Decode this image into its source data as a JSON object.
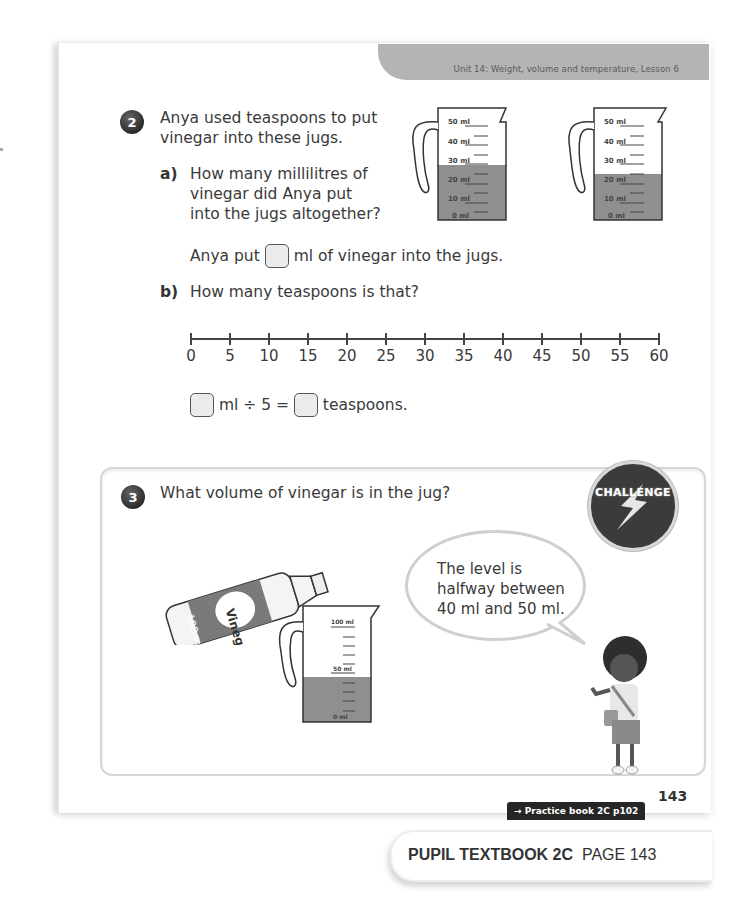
{
  "header": {
    "unit_label": "Unit 14: Weight, volume and temperature, Lesson 6"
  },
  "question2": {
    "number": "2",
    "prompt_line1": "Anya used teaspoons to put",
    "prompt_line2": "vinegar into these jugs.",
    "part_a": {
      "label": "a)",
      "line1": "How many millilitres of",
      "line2": "vinegar did Anya put",
      "line3": "into the jugs altogether?",
      "answer_before": "Anya put",
      "answer_after": "ml of vinegar into the jugs."
    },
    "part_b": {
      "label": "b)",
      "question": "How many teaspoons is that?",
      "equation_mid": "ml ÷ 5 =",
      "equation_end": "teaspoons."
    },
    "jugs": [
      {
        "scale": [
          "50 ml",
          "40 ml",
          "30 ml",
          "20 ml",
          "10 ml",
          "0 ml"
        ],
        "fill_ml": 30
      },
      {
        "scale": [
          "50 ml",
          "40 ml",
          "30 ml",
          "20 ml",
          "10 ml",
          "0 ml"
        ],
        "fill_ml": 20
      }
    ],
    "number_line": {
      "ticks": [
        "0",
        "5",
        "10",
        "15",
        "20",
        "25",
        "30",
        "35",
        "40",
        "45",
        "50",
        "55",
        "60"
      ]
    }
  },
  "question3": {
    "number": "3",
    "prompt": "What volume of vinegar is in the jug?",
    "badge": "CHALLENGE",
    "bottle_label": "Vinegar",
    "bottle_volume": "100 ml",
    "jug_scale": [
      "100 ml",
      "50 ml",
      "0 ml"
    ],
    "speech_line1": "The level is",
    "speech_line2": "halfway between",
    "speech_line3": "40 ml and 50 ml."
  },
  "footer": {
    "practice_link": "→ Practice book 2C p102",
    "page_number": "143",
    "book_title": "PUPIL TEXTBOOK 2C",
    "book_page": "PAGE 143"
  },
  "colors": {
    "banner": "#b4b4b4",
    "liquid": "#8a8a8a",
    "badge": "#3b3b3b"
  }
}
